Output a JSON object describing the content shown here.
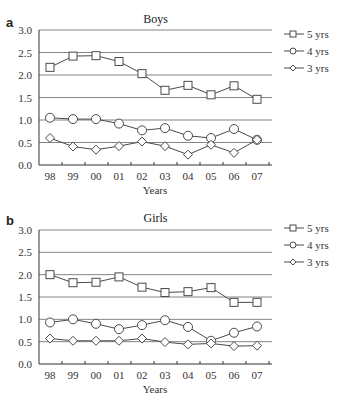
{
  "chart_data": [
    {
      "panel": "a",
      "type": "line",
      "title": "Boys",
      "xlabel": "Years",
      "ylabel": "",
      "categories": [
        "98",
        "99",
        "00",
        "01",
        "02",
        "03",
        "04",
        "05",
        "06",
        "07"
      ],
      "yticks": [
        "0.0",
        "0.5",
        "1.0",
        "1.5",
        "2.0",
        "2.5",
        "3.0"
      ],
      "ylim": [
        0,
        3
      ],
      "grid": true,
      "legend_position": "right",
      "series": [
        {
          "name": "5 yrs",
          "marker": "square",
          "values": [
            2.17,
            2.42,
            2.43,
            2.3,
            2.03,
            1.66,
            1.77,
            1.56,
            1.76,
            1.46
          ]
        },
        {
          "name": "4 yrs",
          "marker": "circle",
          "values": [
            1.05,
            1.02,
            1.02,
            0.92,
            0.77,
            0.82,
            0.65,
            0.6,
            0.8,
            0.56
          ]
        },
        {
          "name": "3 yrs",
          "marker": "diamond",
          "values": [
            0.6,
            0.41,
            0.34,
            0.42,
            0.52,
            0.42,
            0.23,
            0.45,
            0.27,
            0.56
          ]
        }
      ]
    },
    {
      "panel": "b",
      "type": "line",
      "title": "Girls",
      "xlabel": "Years",
      "ylabel": "",
      "categories": [
        "98",
        "99",
        "00",
        "01",
        "02",
        "03",
        "04",
        "05",
        "06",
        "07"
      ],
      "yticks": [
        "0.0",
        "0.5",
        "1.0",
        "1.5",
        "2.0",
        "2.5",
        "3.0"
      ],
      "ylim": [
        0,
        3
      ],
      "grid": true,
      "legend_position": "right",
      "series": [
        {
          "name": "5 yrs",
          "marker": "square",
          "values": [
            2.0,
            1.82,
            1.83,
            1.95,
            1.72,
            1.6,
            1.62,
            1.71,
            1.38,
            1.38
          ]
        },
        {
          "name": "4 yrs",
          "marker": "circle",
          "values": [
            0.93,
            1.0,
            0.9,
            0.78,
            0.87,
            0.98,
            0.83,
            0.52,
            0.7,
            0.84
          ]
        },
        {
          "name": "3 yrs",
          "marker": "diamond",
          "values": [
            0.57,
            0.52,
            0.52,
            0.52,
            0.57,
            0.49,
            0.44,
            0.46,
            0.4,
            0.41
          ]
        }
      ]
    }
  ],
  "panels": [
    {
      "letter": "a",
      "title": "Boys",
      "xlabel": "Years"
    },
    {
      "letter": "b",
      "title": "Girls",
      "xlabel": "Years"
    }
  ],
  "colors": {
    "line": "#4a4a4a",
    "grid": "#666666",
    "marker_fill": "#ffffff",
    "text": "#333333"
  }
}
